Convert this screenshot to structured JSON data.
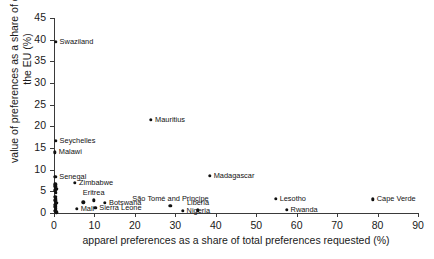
{
  "chart_data": {
    "type": "scatter",
    "title": "",
    "xlabel": "apparel preferences as a share of total preferences requested (%)",
    "ylabel": "value of preferences as a share of exports to the EU (%)",
    "xlim": [
      0,
      90
    ],
    "ylim": [
      0,
      45
    ],
    "xticks": [
      0,
      10,
      20,
      30,
      40,
      50,
      60,
      70,
      80,
      90
    ],
    "yticks": [
      0,
      5,
      10,
      15,
      20,
      25,
      30,
      35,
      40,
      45
    ],
    "xtick_labels": [
      "0",
      "10",
      "20",
      "30",
      "40",
      "50",
      "60",
      "70",
      "80",
      "90"
    ],
    "ytick_labels": [
      "0",
      "5",
      "10",
      "15",
      "20",
      "25",
      "30",
      "35",
      "40",
      "45"
    ],
    "grid": false,
    "legend": "none",
    "marker_color": "#111111",
    "axis_color": "#3a3a3a",
    "points": [
      {
        "label": "Swaziland",
        "x": 0.4,
        "y": 39.5,
        "label_pos": "right"
      },
      {
        "label": "Mauritius",
        "x": 24.0,
        "y": 21.5,
        "label_pos": "right"
      },
      {
        "label": "Seychelles",
        "x": 0.4,
        "y": 16.7,
        "label_pos": "right"
      },
      {
        "label": "Malawi",
        "x": 0.2,
        "y": 14.0,
        "label_pos": "right"
      },
      {
        "label": "Madagascar",
        "x": 38.5,
        "y": 8.6,
        "label_pos": "right"
      },
      {
        "label": "Senegal",
        "x": 0.3,
        "y": 8.3,
        "label_pos": "right"
      },
      {
        "label": "Zimbabwe",
        "x": 5.2,
        "y": 7.0,
        "label_pos": "right"
      },
      {
        "label": "",
        "x": 0.3,
        "y": 6.6,
        "label_pos": "none"
      },
      {
        "label": "",
        "x": 0.3,
        "y": 6.2,
        "label_pos": "none"
      },
      {
        "label": "",
        "x": 0.6,
        "y": 5.6,
        "label_pos": "none"
      },
      {
        "label": "",
        "x": 0.3,
        "y": 5.2,
        "label_pos": "none"
      },
      {
        "label": "",
        "x": 0.4,
        "y": 4.6,
        "label_pos": "none"
      },
      {
        "label": "",
        "x": 0.3,
        "y": 3.8,
        "label_pos": "none"
      },
      {
        "label": "",
        "x": 0.5,
        "y": 3.3,
        "label_pos": "none"
      },
      {
        "label": "",
        "x": 0.3,
        "y": 2.9,
        "label_pos": "none"
      },
      {
        "label": "",
        "x": 0.6,
        "y": 2.4,
        "label_pos": "none"
      },
      {
        "label": "",
        "x": 0.3,
        "y": 1.9,
        "label_pos": "none"
      },
      {
        "label": "",
        "x": 0.3,
        "y": 1.4,
        "label_pos": "none"
      },
      {
        "label": "",
        "x": 0.4,
        "y": 0.9,
        "label_pos": "none"
      },
      {
        "label": "",
        "x": 0.3,
        "y": 0.5,
        "label_pos": "none"
      },
      {
        "label": "",
        "x": 0.6,
        "y": 0.2,
        "label_pos": "none"
      },
      {
        "label": "Eritrea",
        "x": 9.8,
        "y": 2.9,
        "label_pos": "above"
      },
      {
        "label": "",
        "x": 7.2,
        "y": 2.5,
        "label_pos": "none"
      },
      {
        "label": "Botswana",
        "x": 12.6,
        "y": 2.4,
        "label_pos": "right"
      },
      {
        "label": "Sierra Leone",
        "x": 10.2,
        "y": 1.2,
        "label_pos": "right"
      },
      {
        "label": "Mali",
        "x": 5.6,
        "y": 0.9,
        "label_pos": "right"
      },
      {
        "label": "São Tomé and Principe",
        "x": 28.8,
        "y": 1.6,
        "label_pos": "above"
      },
      {
        "label": "Nigeria",
        "x": 31.8,
        "y": 0.5,
        "label_pos": "right"
      },
      {
        "label": "Liberia",
        "x": 35.6,
        "y": 0.6,
        "label_pos": "above"
      },
      {
        "label": "Lesotho",
        "x": 54.8,
        "y": 3.3,
        "label_pos": "right"
      },
      {
        "label": "Rwanda",
        "x": 57.5,
        "y": 0.8,
        "label_pos": "right"
      },
      {
        "label": "Cape Verde",
        "x": 78.8,
        "y": 3.2,
        "label_pos": "right"
      }
    ]
  }
}
